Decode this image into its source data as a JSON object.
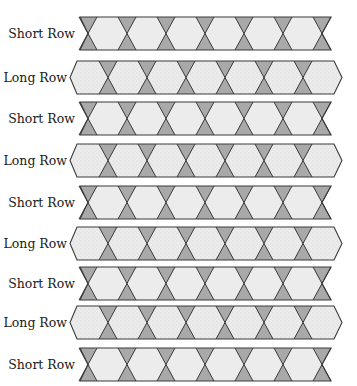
{
  "diagram": {
    "colors": {
      "band_fill": "#ececec",
      "long_fill": "#e9e9e9",
      "triangle_fill": "#a9a9a9",
      "stroke": "#3a3a3a",
      "text": "#1a1a1a"
    },
    "geometry": {
      "row_height": 33,
      "triangle_half_width": 9,
      "short": {
        "left": 80,
        "right": 331,
        "crossings": [
          88,
          127,
          166,
          205,
          244,
          283,
          322
        ]
      },
      "long": {
        "tip_left": 70,
        "corner_left": 77,
        "corner_right": 334,
        "tip_right": 342,
        "crossings": [
          108,
          147,
          186,
          225,
          264,
          303
        ]
      }
    },
    "rows": [
      {
        "label": "Short Row",
        "type": "short",
        "top": 17
      },
      {
        "label": "Long Row",
        "type": "long",
        "top": 61
      },
      {
        "label": "Short Row",
        "type": "short",
        "top": 102
      },
      {
        "label": "Long Row",
        "type": "long",
        "top": 144
      },
      {
        "label": "Short Row",
        "type": "short",
        "top": 186
      },
      {
        "label": "Long Row",
        "type": "long",
        "top": 227
      },
      {
        "label": "Short Row",
        "type": "short",
        "top": 267
      },
      {
        "label": "Long Row",
        "type": "long",
        "top": 306
      },
      {
        "label": "Short Row",
        "type": "short",
        "top": 348
      }
    ]
  }
}
